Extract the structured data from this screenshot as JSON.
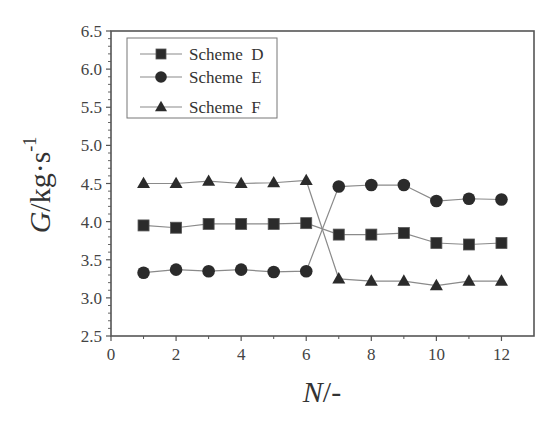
{
  "chart_data": {
    "type": "line",
    "title": "",
    "xlabel": "N/-",
    "xlabel_italic": "N",
    "xlabel_rest": "/-",
    "ylabel": "G/kg·s^-1",
    "ylabel_italic": "G",
    "ylabel_rest": "/kg·s",
    "ylabel_sup": "-1",
    "xlim": [
      0,
      13
    ],
    "ylim": [
      2.5,
      6.5
    ],
    "xticks": [
      0,
      2,
      4,
      6,
      8,
      10,
      12
    ],
    "xtick_labels": [
      "0",
      "2",
      "4",
      "6",
      "8",
      "10",
      "12"
    ],
    "yticks": [
      2.5,
      3.0,
      3.5,
      4.0,
      4.5,
      5.0,
      5.5,
      6.0,
      6.5
    ],
    "ytick_labels": [
      "2.5",
      "3.0",
      "3.5",
      "4.0",
      "4.5",
      "5.0",
      "5.5",
      "6.0",
      "6.5"
    ],
    "grid": false,
    "legend_position": "upper left",
    "x": [
      1,
      2,
      3,
      4,
      5,
      6,
      7,
      8,
      9,
      10,
      11,
      12
    ],
    "series": [
      {
        "name": "Scheme D",
        "marker": "square",
        "values": [
          3.95,
          3.92,
          3.97,
          3.97,
          3.97,
          3.98,
          3.83,
          3.83,
          3.85,
          3.72,
          3.7,
          3.72
        ]
      },
      {
        "name": "Scheme E",
        "marker": "circle",
        "values": [
          3.33,
          3.37,
          3.35,
          3.37,
          3.34,
          3.35,
          4.46,
          4.48,
          4.48,
          4.27,
          4.3,
          4.29
        ]
      },
      {
        "name": "Scheme F",
        "marker": "triangle",
        "values": [
          4.5,
          4.5,
          4.53,
          4.5,
          4.51,
          4.54,
          3.25,
          3.22,
          3.22,
          3.16,
          3.22,
          3.22
        ]
      }
    ],
    "colors": {
      "marker": "#2b2b2b",
      "line": "#8a8a8a",
      "axis": "#555555"
    }
  }
}
